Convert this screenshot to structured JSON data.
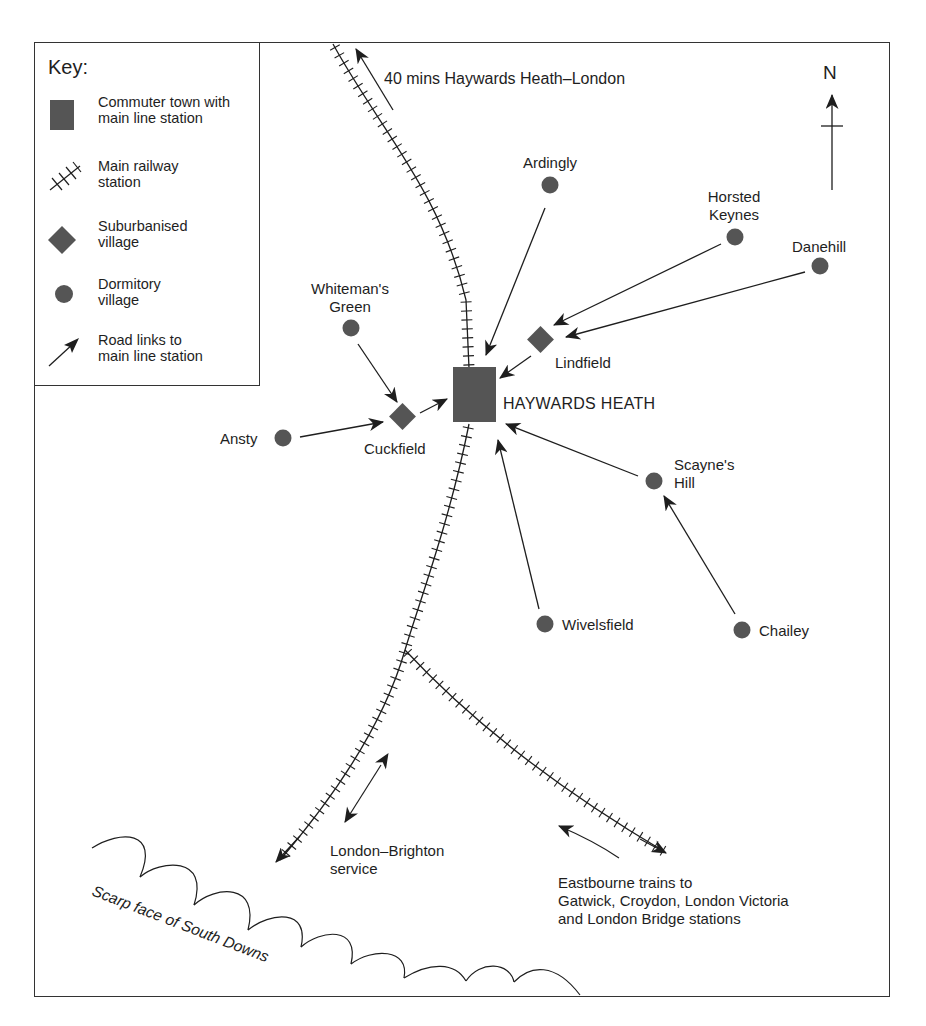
{
  "key": {
    "title": "Key:",
    "items": [
      {
        "symbol": "filled-square",
        "label": "Commuter town with\nmain line station"
      },
      {
        "symbol": "railway-track",
        "label": "Main railway\nstation"
      },
      {
        "symbol": "filled-diamond",
        "label": "Suburbanised\nvillage"
      },
      {
        "symbol": "filled-circle",
        "label": "Dormitory\nvillage"
      },
      {
        "symbol": "arrow",
        "label": "Road links to\nmain line station"
      }
    ]
  },
  "compass": {
    "label": "N",
    "icon": "north-arrow-icon"
  },
  "commuter_town": {
    "name": "HAYWARDS HEATH"
  },
  "suburbanised_villages": [
    {
      "name": "Lindfield"
    },
    {
      "name": "Cuckfield"
    }
  ],
  "dormitory_villages": [
    {
      "name": "Ardingly"
    },
    {
      "name": "Horsted\nKeynes"
    },
    {
      "name": "Danehill"
    },
    {
      "name": "Whiteman's\nGreen"
    },
    {
      "name": "Ansty"
    },
    {
      "name": "Scayne's\nHill"
    },
    {
      "name": "Wivelsfield"
    },
    {
      "name": "Chailey"
    }
  ],
  "rail_annotations": {
    "london": "40 mins Haywards Heath–London",
    "brighton": "London–Brighton\nservice",
    "eastbourne": "Eastbourne trains to\nGatwick, Croydon, London Victoria\nand London Bridge stations"
  },
  "relief": {
    "label": "Scarp face of South Downs"
  },
  "colors": {
    "symbol_fill": "#555555",
    "line": "#1e1e1e",
    "frame": "#333333"
  }
}
